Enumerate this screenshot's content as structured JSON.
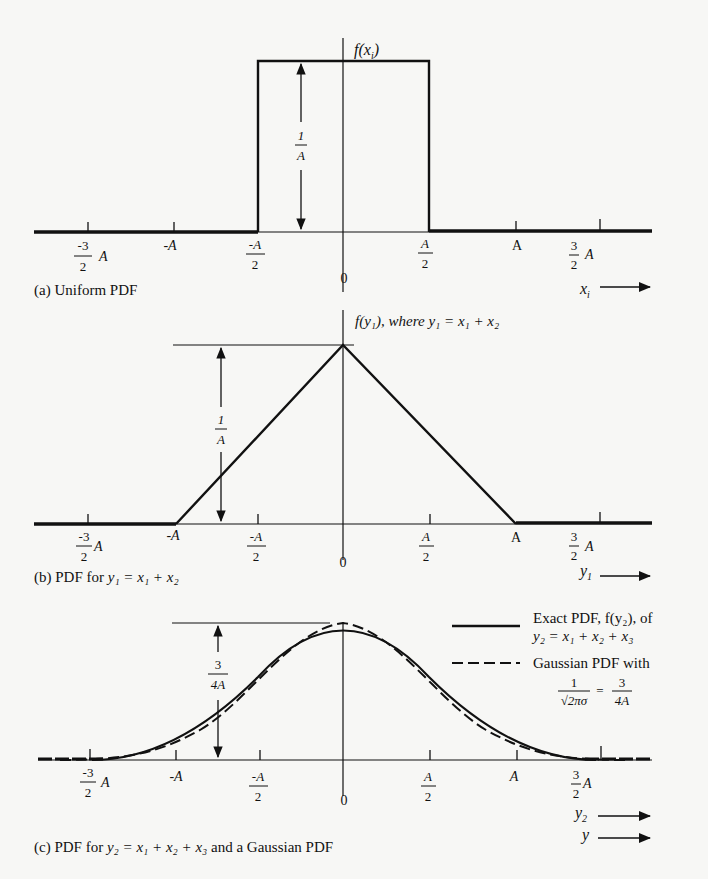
{
  "figure": {
    "background": "#f7f7f5",
    "ink": "#111111"
  },
  "panel_a": {
    "caption": "(a) Uniform PDF",
    "y_axis_label": "f(x",
    "y_axis_sub": "i",
    "y_axis_close": ")",
    "height_label": {
      "num": "1",
      "den": "A"
    },
    "x_axis_var": "x",
    "x_axis_sub": "i",
    "ticks": [
      {
        "id": "m3h",
        "num": "-3",
        "den": "2",
        "suffix": "A"
      },
      {
        "id": "mA",
        "text": "-A"
      },
      {
        "id": "mAh",
        "num": "-A",
        "den": "2"
      },
      {
        "id": "zero",
        "text": "0"
      },
      {
        "id": "Ah",
        "num": "A",
        "den": "2"
      },
      {
        "id": "A",
        "text": "A"
      },
      {
        "id": "p3h",
        "num": "3",
        "den": "2",
        "suffix": "A"
      }
    ]
  },
  "panel_b": {
    "caption_prefix": "(b) PDF for ",
    "caption_eq": "y₁ = x₁ + x₂",
    "y_axis_label": "f(y₁), where y₁ = x₁ + x₂",
    "height_label": {
      "num": "1",
      "den": "A"
    },
    "x_axis_var": "y",
    "x_axis_sub": "1",
    "ticks": [
      {
        "id": "m3h",
        "num": "-3",
        "den": "2",
        "suffix": "A"
      },
      {
        "id": "mA",
        "text": "-A"
      },
      {
        "id": "mAh",
        "num": "-A",
        "den": "2"
      },
      {
        "id": "zero",
        "text": "0"
      },
      {
        "id": "Ah",
        "num": "A",
        "den": "2"
      },
      {
        "id": "A",
        "text": "A"
      },
      {
        "id": "p3h",
        "num": "3",
        "den": "2",
        "suffix": "A"
      }
    ]
  },
  "panel_c": {
    "caption_prefix": "(c) PDF for ",
    "caption_eq": "y₂ = x₁ + x₂ + x₃",
    "caption_suffix": " and a Gaussian PDF",
    "height_label": {
      "num": "3",
      "den": "4A"
    },
    "x_axis_var": "y",
    "x_axis_sub": "2",
    "x_axis_var2": "y",
    "legend": {
      "solid_line1": "Exact PDF, f(y₂), of",
      "solid_line2": "y₂ = x₁ + x₂ + x₃",
      "dashed_line1": "Gaussian PDF with",
      "dashed_eq_num": "1",
      "dashed_eq_den": "√2πσ",
      "dashed_eq_eq": "=",
      "dashed_eq_rnum": "3",
      "dashed_eq_rden": "4A"
    },
    "ticks": [
      {
        "id": "m3h",
        "num": "-3",
        "den": "2",
        "suffix": "A"
      },
      {
        "id": "mA",
        "text": "-A"
      },
      {
        "id": "mAh",
        "num": "-A",
        "den": "2"
      },
      {
        "id": "zero",
        "text": "0"
      },
      {
        "id": "Ah",
        "num": "A",
        "den": "2"
      },
      {
        "id": "A",
        "text": "A"
      },
      {
        "id": "p3h",
        "num": "3",
        "den": "2",
        "suffix": "A"
      }
    ]
  }
}
